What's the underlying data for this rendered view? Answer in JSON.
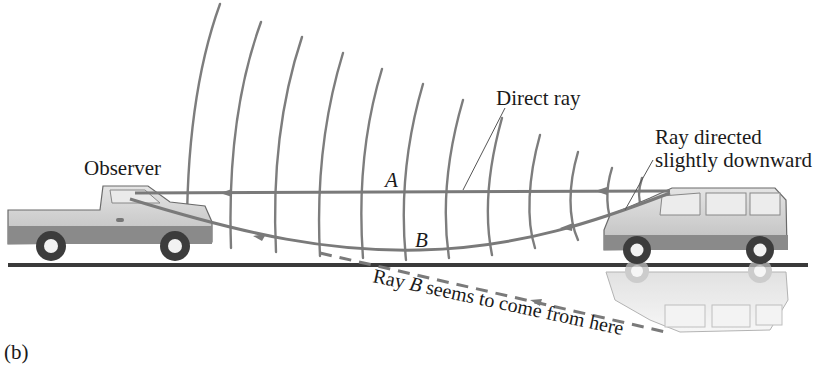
{
  "figure": {
    "panel_label": "(b)",
    "labels": {
      "observer": "Observer",
      "direct_ray": "Direct ray",
      "ray_directed_line1": "Ray directed",
      "ray_directed_line2": "slightly downward",
      "ray_a": "A",
      "ray_b": "B",
      "ray_b_source_prefix": "Ray ",
      "ray_b_source_italic": "B",
      "ray_b_source_suffix": " seems to come from here"
    },
    "objects": {
      "observer_vehicle": "pickup-truck",
      "source_vehicle": "minivan",
      "source_reflection": "minivan-mirror-image"
    },
    "colors": {
      "ray": "#7a7a7a",
      "wavefront": "#7d7d7d",
      "ground": "#3a3a3a",
      "vehicle_body": "#d2d2d2",
      "vehicle_lower": "#8a8a8a",
      "text": "#1a1a1a"
    }
  }
}
